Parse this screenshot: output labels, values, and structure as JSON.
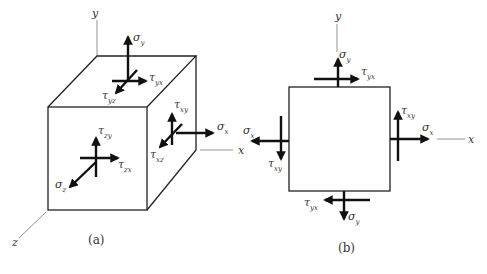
{
  "panels": [
    {
      "id": "a",
      "caption": "(a)",
      "type": "3d-stress-element",
      "axes": {
        "x": "x",
        "y": "y",
        "z": "z"
      },
      "labels": {
        "sigma_y": {
          "base": "σ",
          "sub": "y"
        },
        "tau_yx": {
          "base": "τ",
          "sub": "yx"
        },
        "tau_yz": {
          "base": "τ",
          "sub": "yz"
        },
        "tau_xy": {
          "base": "τ",
          "sub": "xy"
        },
        "sigma_x": {
          "base": "σ",
          "sub": "x"
        },
        "tau_xz": {
          "base": "τ",
          "sub": "xz"
        },
        "tau_zy": {
          "base": "τ",
          "sub": "zy"
        },
        "tau_zx": {
          "base": "τ",
          "sub": "zx"
        },
        "sigma_z": {
          "base": "σ",
          "sub": "z"
        }
      }
    },
    {
      "id": "b",
      "caption": "(b)",
      "type": "2d-stress-element",
      "axes": {
        "x": "x",
        "y": "y"
      },
      "labels": {
        "sigma_y_top": {
          "base": "σ",
          "sub": "y"
        },
        "tau_yx_top": {
          "base": "τ",
          "sub": "yx"
        },
        "sigma_x_left": {
          "base": "σ",
          "sub": "x"
        },
        "tau_xy_left": {
          "base": "τ",
          "sub": "xy"
        },
        "tau_xy_right": {
          "base": "τ",
          "sub": "xy"
        },
        "sigma_x_right": {
          "base": "σ",
          "sub": "x"
        },
        "tau_yx_bottom": {
          "base": "τ",
          "sub": "yx"
        },
        "sigma_y_bottom": {
          "base": "σ",
          "sub": "y"
        }
      }
    }
  ],
  "colors": {
    "stroke": "#111111",
    "axis": "#777777",
    "text": "#333333"
  }
}
